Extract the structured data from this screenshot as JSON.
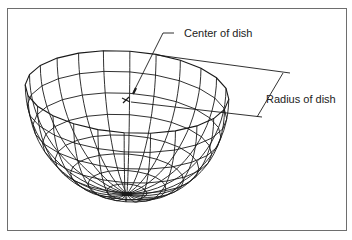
{
  "figure": {
    "type": "wireframe-hemisphere",
    "labels": {
      "center": "Center of dish",
      "radius": "Radius of dish"
    },
    "colors": {
      "line": "#1a1a1a",
      "frame": "#6e6e6e",
      "background": "#ffffff"
    },
    "wireframe": {
      "meridians": 24,
      "parallels": 8
    }
  }
}
